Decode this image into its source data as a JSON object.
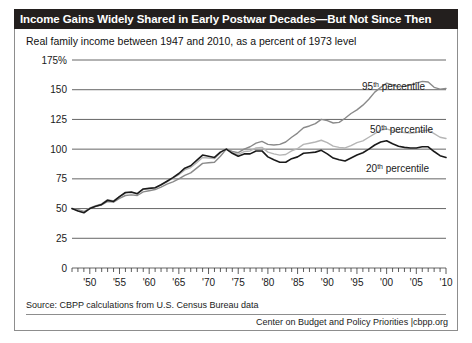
{
  "figure": {
    "title": "Income Gains Widely Shared in Early Postwar Decades—But Not Since Then",
    "subtitle": "Real family income between 1947 and 2010, as a percent of 1973 level",
    "source": "Source: CBPP calculations from U.S. Census Bureau data",
    "credit": "Center on Budget and Policy Priorities |cbpp.org",
    "colors": {
      "title_bar_background": "#231f1e",
      "title_text": "#ffffff",
      "panel_background": "#ffffff",
      "panel_border": "#8d8d8d",
      "gridline": "#555555",
      "series_95th": "#8a8a8a",
      "series_50th": "#b5b5b5",
      "series_20th": "#1a1a1a"
    }
  },
  "chart_data": {
    "type": "line",
    "title": "Income Gains Widely Shared in Early Postwar Decades—But Not Since Then",
    "subtitle": "Real family income between 1947 and 2010, as a percent of 1973 level",
    "xlabel": "",
    "ylabel": "",
    "grid": true,
    "legend_position": "inline-right",
    "xlim": [
      1947,
      2010
    ],
    "ylim": [
      0,
      175
    ],
    "ytick_labels": [
      "175%",
      "150",
      "125",
      "100",
      "75",
      "50",
      "25",
      "0"
    ],
    "yticks": [
      175,
      150,
      125,
      100,
      75,
      50,
      25,
      0
    ],
    "xtick_labels": [
      "'50",
      "'55",
      "'60",
      "'65",
      "'70",
      "'75",
      "'80",
      "'85",
      "'90",
      "'95",
      "'00",
      "'05",
      "'10"
    ],
    "xticks": [
      1950,
      1955,
      1960,
      1965,
      1970,
      1975,
      1980,
      1985,
      1990,
      1995,
      2000,
      2005,
      2010
    ],
    "minor_xtick_interval": 1,
    "x": [
      1947,
      1948,
      1949,
      1950,
      1951,
      1952,
      1953,
      1954,
      1955,
      1956,
      1957,
      1958,
      1959,
      1960,
      1961,
      1962,
      1963,
      1964,
      1965,
      1966,
      1967,
      1968,
      1969,
      1970,
      1971,
      1972,
      1973,
      1974,
      1975,
      1976,
      1977,
      1978,
      1979,
      1980,
      1981,
      1982,
      1983,
      1984,
      1985,
      1986,
      1987,
      1988,
      1989,
      1990,
      1991,
      1992,
      1993,
      1994,
      1995,
      1996,
      1997,
      1998,
      1999,
      2000,
      2001,
      2002,
      2003,
      2004,
      2005,
      2006,
      2007,
      2008,
      2009,
      2010
    ],
    "series": [
      {
        "name": "95th percentile",
        "color": "#8a8a8a",
        "values": [
          50,
          49,
          47.5,
          50,
          52,
          53,
          56,
          55.5,
          58.5,
          61,
          61.5,
          61,
          64,
          65,
          66,
          68,
          70.5,
          72.5,
          75,
          78,
          80,
          84,
          88,
          88.5,
          89,
          94,
          100,
          98,
          97,
          100,
          102,
          105,
          106.5,
          104,
          103.5,
          104,
          106,
          110,
          113.5,
          118,
          119.5,
          121.5,
          125,
          124,
          122,
          122.5,
          126,
          130,
          133,
          137,
          142,
          148,
          152,
          155.5,
          154,
          152.5,
          153,
          154,
          155.5,
          157,
          156.5,
          152,
          150.5,
          151
        ]
      },
      {
        "name": "50th percentile",
        "color": "#b5b5b5",
        "values": [
          50,
          48.5,
          47,
          50.5,
          52.5,
          54,
          57.5,
          56.5,
          60,
          63,
          63.5,
          62.5,
          66,
          67,
          67.5,
          70,
          72.5,
          75.5,
          78.5,
          82.5,
          84.5,
          88.5,
          93,
          92.5,
          92,
          97,
          100,
          97,
          95.5,
          98,
          98.5,
          101,
          101.5,
          97.5,
          96,
          95,
          95.5,
          98.5,
          100.5,
          104,
          105,
          106,
          107.5,
          105.5,
          102.5,
          101.5,
          101,
          103,
          105.5,
          107,
          110,
          113,
          116,
          117,
          115.5,
          114.5,
          114,
          113.5,
          114,
          115.5,
          116,
          113,
          110,
          109
        ]
      },
      {
        "name": "20th percentile",
        "color": "#1a1a1a",
        "values": [
          50,
          48,
          46.5,
          50,
          52,
          53.5,
          57,
          56,
          60,
          63.5,
          64,
          62.5,
          66.5,
          67,
          67.5,
          70,
          73,
          76,
          79.5,
          84,
          86,
          90.5,
          95,
          94,
          93,
          97.5,
          100,
          96.5,
          94,
          96,
          96,
          98.5,
          98.5,
          93.5,
          91,
          89,
          89,
          92,
          93.5,
          96.5,
          97,
          97.5,
          99,
          96,
          92.5,
          91,
          90,
          92.5,
          95,
          97,
          100,
          103.5,
          106,
          107,
          104.5,
          102.5,
          101.5,
          101,
          101,
          102,
          102,
          98,
          94.5,
          93
        ]
      }
    ]
  }
}
